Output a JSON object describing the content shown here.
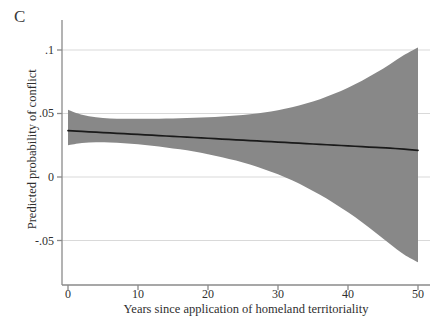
{
  "panel": {
    "label": "C"
  },
  "chart_data": {
    "type": "area",
    "title": "",
    "subtitle": "",
    "xlabel": "Years since application of homeland territoriality",
    "ylabel": "Predicted probability of conflict",
    "xlim": [
      -1,
      51
    ],
    "ylim": [
      -0.072,
      0.108
    ],
    "xticks": [
      0,
      10,
      20,
      30,
      40,
      50
    ],
    "xticklabels": [
      "0",
      "10",
      "20",
      "30",
      "40",
      "50"
    ],
    "yticks": [
      0.1,
      0.05,
      0,
      -0.05
    ],
    "yticklabels": [
      ".1",
      ".05",
      "0",
      "-.05"
    ],
    "grid": "horizontal",
    "grid_color": "#d9d9d9",
    "legend": "none",
    "band_color": "#888888",
    "line_color": "#1a1a1a",
    "axis_color": "#8a8a8a",
    "x": [
      0,
      2,
      4,
      6,
      8,
      10,
      12,
      14,
      16,
      18,
      20,
      22,
      24,
      26,
      28,
      30,
      32,
      34,
      36,
      38,
      40,
      42,
      44,
      46,
      48,
      50
    ],
    "series": [
      {
        "name": "Predicted probability of conflict",
        "values": [
          0.0365,
          0.0359,
          0.0353,
          0.0347,
          0.0341,
          0.0335,
          0.0329,
          0.0323,
          0.0317,
          0.0311,
          0.0305,
          0.0299,
          0.0293,
          0.0287,
          0.0281,
          0.0275,
          0.0269,
          0.0263,
          0.0257,
          0.0251,
          0.0245,
          0.0239,
          0.0233,
          0.0227,
          0.0219,
          0.021
        ]
      },
      {
        "name": "95% confidence interval upper",
        "values": [
          0.053,
          0.049,
          0.047,
          0.046,
          0.0458,
          0.0458,
          0.0459,
          0.0461,
          0.0463,
          0.0466,
          0.047,
          0.0476,
          0.0484,
          0.0494,
          0.0508,
          0.0526,
          0.0549,
          0.0578,
          0.0613,
          0.0655,
          0.0703,
          0.0758,
          0.082,
          0.0888,
          0.096,
          0.102
        ]
      },
      {
        "name": "95% confidence interval lower",
        "values": [
          0.025,
          0.0268,
          0.0274,
          0.0272,
          0.0266,
          0.0257,
          0.0246,
          0.0233,
          0.0218,
          0.02,
          0.018,
          0.0156,
          0.0129,
          0.0098,
          0.0062,
          0.0021,
          -0.0026,
          -0.008,
          -0.014,
          -0.0206,
          -0.0278,
          -0.0356,
          -0.044,
          -0.0528,
          -0.061,
          -0.0672
        ]
      }
    ],
    "annotations": []
  }
}
